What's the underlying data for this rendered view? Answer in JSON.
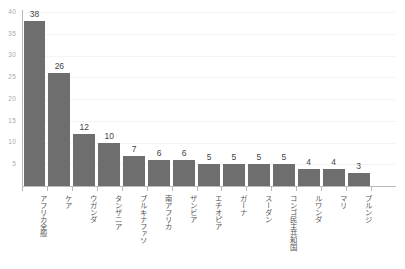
{
  "chart_data": {
    "type": "bar",
    "title": "",
    "subtitle": "",
    "xlabel": "",
    "ylabel": "",
    "ylim": [
      0,
      40
    ],
    "grid": true,
    "legend": false,
    "orientation": "vertical",
    "bar_color": "#6e6e6e",
    "axis_color": "#b9b9b9",
    "gridline_color": "#f4f4f4",
    "tick_label_color": "#a8a8a8",
    "value_label_color": "#454545",
    "category_label_color": "#555555",
    "background_color": "#ffffff",
    "y_ticks": [
      5,
      10,
      15,
      20,
      25,
      30,
      35,
      40
    ],
    "y_tick_labels": [
      "5",
      "10",
      "15",
      "20",
      "25",
      "30",
      "35",
      "40"
    ],
    "categories": [
      "アフリカ全般",
      "ケア",
      "ウガンダ",
      "タンザニア",
      "ブルキナファソ",
      "南アフリカ",
      "ザンビア",
      "エチオピア",
      "ガーナ",
      "スーダン",
      "コンゴ民主共和国",
      "ルワンダ",
      "マリ",
      "ブルンジ"
    ],
    "values": [
      38,
      26,
      12,
      10,
      7,
      6,
      6,
      5,
      5,
      5,
      5,
      4,
      4,
      3
    ],
    "value_labels": [
      "38",
      "26",
      "12",
      "10",
      "7",
      "6",
      "6",
      "5",
      "5",
      "5",
      "5",
      "4",
      "4",
      "3"
    ],
    "bars": [
      {
        "label": "アフリカ全般",
        "value": 38,
        "value_label": "38"
      },
      {
        "label": "ケア",
        "value": 26,
        "value_label": "26"
      },
      {
        "label": "ウガンダ",
        "value": 12,
        "value_label": "12"
      },
      {
        "label": "タンザニア",
        "value": 10,
        "value_label": "10"
      },
      {
        "label": "ブルキナファソ",
        "value": 7,
        "value_label": "7"
      },
      {
        "label": "南アフリカ",
        "value": 6,
        "value_label": "6"
      },
      {
        "label": "ザンビア",
        "value": 6,
        "value_label": "6"
      },
      {
        "label": "エチオピア",
        "value": 5,
        "value_label": "5"
      },
      {
        "label": "ガーナ",
        "value": 5,
        "value_label": "5"
      },
      {
        "label": "スーダン",
        "value": 5,
        "value_label": "5"
      },
      {
        "label": "コンゴ民主共和国",
        "value": 5,
        "value_label": "5"
      },
      {
        "label": "ルワンダ",
        "value": 4,
        "value_label": "4"
      },
      {
        "label": "マリ",
        "value": 4,
        "value_label": "4"
      },
      {
        "label": "ブルンジ",
        "value": 3,
        "value_label": "3"
      }
    ]
  }
}
